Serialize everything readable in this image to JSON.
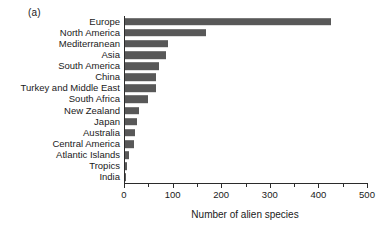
{
  "panel": {
    "label": "(a)"
  },
  "chart_data": {
    "type": "bar",
    "orientation": "horizontal",
    "title": "",
    "subtitle": "",
    "xlabel": "Number of alien species",
    "ylabel": "",
    "xlim": [
      0,
      500
    ],
    "xticks": [
      0,
      100,
      200,
      300,
      400,
      500
    ],
    "xticklabels": [
      "0",
      "100",
      "200",
      "300",
      "400",
      "500"
    ],
    "minor_tick_interval": 50,
    "grid": false,
    "legend": null,
    "bar_color": "#585858",
    "axis_color": "#2b2b2b",
    "categories": [
      "Europe",
      "North America",
      "Mediterranean",
      "Asia",
      "South America",
      "China",
      "Turkey and Middle East",
      "South Africa",
      "New Zealand",
      "Japan",
      "Australia",
      "Central America",
      "Atlantic Islands",
      "Tropics",
      "India"
    ],
    "values": [
      424,
      167,
      88,
      84,
      70,
      63,
      63,
      48,
      29,
      25,
      21,
      19,
      8,
      4,
      2
    ]
  }
}
